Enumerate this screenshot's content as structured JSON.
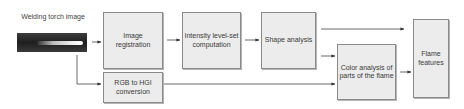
{
  "diagram": {
    "input": {
      "label": "Welding torch image"
    },
    "nodes": {
      "image_registration": "Image registration",
      "rgb_to_hgi": "RGB to HGI conversion",
      "intensity": "Intensity level-set computation",
      "shape_analysis": "Shape analysis",
      "color_analysis": "Color analysis of parts of the flame",
      "flame_features": "Flame features"
    },
    "edges": [
      [
        "Welding torch image",
        "Image registration"
      ],
      [
        "Welding torch image",
        "RGB to HGI conversion"
      ],
      [
        "Image registration",
        "Intensity level-set computation"
      ],
      [
        "Intensity level-set computation",
        "Shape analysis"
      ],
      [
        "Shape analysis",
        "Flame features"
      ],
      [
        "Shape analysis",
        "Color analysis of parts of the flame"
      ],
      [
        "RGB to HGI conversion",
        "Color analysis of parts of the flame"
      ],
      [
        "Color analysis of parts of the flame",
        "Flame features"
      ]
    ]
  }
}
